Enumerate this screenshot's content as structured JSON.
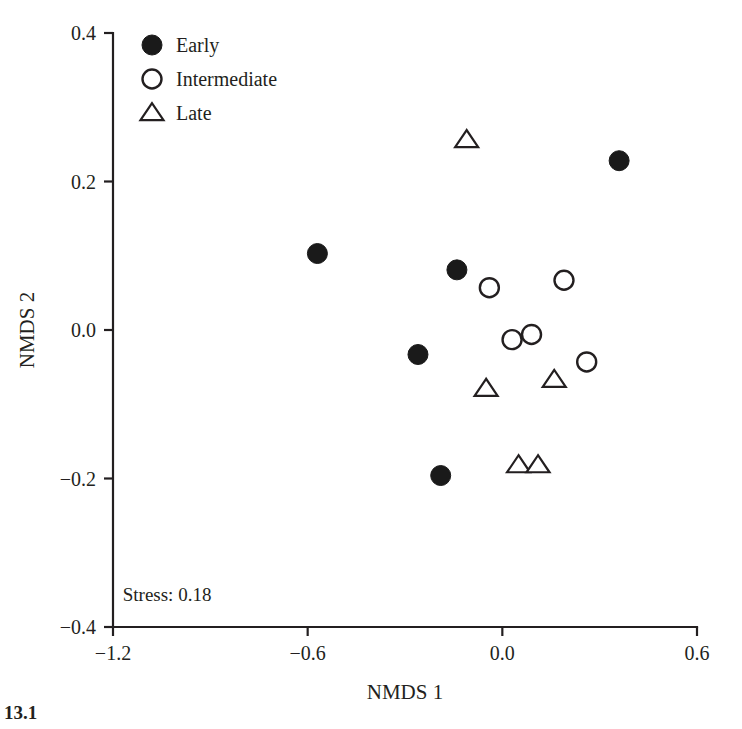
{
  "figure": {
    "caption_fragment": "13.1"
  },
  "chart_data": {
    "type": "scatter",
    "title": "",
    "xlabel": "NMDS 1",
    "ylabel": "NMDS 2",
    "xlim": [
      -1.2,
      0.6
    ],
    "ylim": [
      -0.4,
      0.4
    ],
    "xticks": [
      -1.2,
      -0.6,
      0.0,
      0.6
    ],
    "xticklabels": [
      "−1.2",
      "−0.6",
      "0.0",
      "0.6"
    ],
    "yticks": [
      -0.4,
      -0.2,
      0.0,
      0.2,
      0.4
    ],
    "yticklabels": [
      "−0.4",
      "−0.2",
      "0.0",
      "0.2",
      "0.4"
    ],
    "grid": false,
    "legend_position": "top-left",
    "annotations": [
      {
        "text": "Stress: 0.18",
        "x": -1.17,
        "y": -0.365
      }
    ],
    "series": [
      {
        "name": "Early",
        "marker": "filled-circle",
        "color": "#1a1a1a",
        "points": [
          {
            "x": -0.57,
            "y": 0.103
          },
          {
            "x": -0.14,
            "y": 0.081
          },
          {
            "x": -0.26,
            "y": -0.033
          },
          {
            "x": -0.19,
            "y": -0.196
          },
          {
            "x": 0.36,
            "y": 0.228
          }
        ]
      },
      {
        "name": "Intermediate",
        "marker": "open-circle",
        "color": "#231f20",
        "points": [
          {
            "x": -0.04,
            "y": 0.057
          },
          {
            "x": 0.19,
            "y": 0.067
          },
          {
            "x": 0.03,
            "y": -0.013
          },
          {
            "x": 0.09,
            "y": -0.006
          },
          {
            "x": 0.26,
            "y": -0.043
          }
        ]
      },
      {
        "name": "Late",
        "marker": "open-triangle",
        "color": "#231f20",
        "points": [
          {
            "x": -0.11,
            "y": 0.256
          },
          {
            "x": -0.05,
            "y": -0.079
          },
          {
            "x": 0.16,
            "y": -0.067
          },
          {
            "x": 0.05,
            "y": -0.182
          },
          {
            "x": 0.11,
            "y": -0.182
          }
        ]
      }
    ]
  }
}
